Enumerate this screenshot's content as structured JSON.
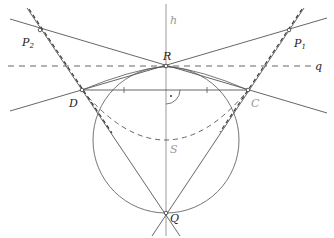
{
  "figure": {
    "type": "geometric-construction",
    "colors": {
      "line": "#555555",
      "axis": "#aaaaaa",
      "text": "#222222",
      "text_muted": "#999999",
      "background": "#ffffff"
    },
    "labels": {
      "h": "h",
      "q": "q",
      "R": "R",
      "Q": "Q",
      "S": "S",
      "D": "D",
      "C": "C",
      "P1": "P",
      "P1_sub": "1",
      "P2": "P",
      "P2_sub": "2"
    },
    "points": {
      "R": [
        166,
        66
      ],
      "Q": [
        166,
        213
      ],
      "D": [
        82,
        90
      ],
      "C": [
        248,
        90
      ],
      "P1": [
        289,
        30
      ],
      "P2": [
        40,
        30
      ],
      "S": [
        166,
        140
      ]
    },
    "circle": {
      "center": [
        166,
        140
      ],
      "radius": 73
    },
    "right_angle_marker": "·"
  }
}
